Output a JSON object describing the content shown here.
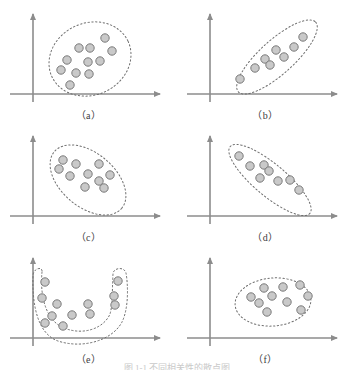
{
  "figure": {
    "caption_partial": "图 1-1  不同相关性的散点图",
    "axis_color": "#8c8c8c",
    "contour_color": "#6e6e6e",
    "dot_fill": "#c9c9c9",
    "dot_stroke": "#7a7a7a",
    "label_color": "#3c3c3c",
    "background": "#ffffff",
    "dot_radius": 4.2
  },
  "chart_data": {
    "type": "scatter",
    "xlabel": "",
    "ylabel": "",
    "grid": false,
    "legend": null,
    "panels": [
      {
        "id": "a",
        "label": "（a）",
        "description": "Circular / no-correlation cloud, dots spread evenly inside a round dotted contour",
        "correlation": "none",
        "contour_shape": "ellipse",
        "contour": {
          "cx": 90,
          "cy": 57,
          "rx": 42,
          "ry": 36,
          "rotate": -25
        },
        "points": [
          [
            105,
            36
          ],
          [
            79,
            46
          ],
          [
            90,
            46
          ],
          [
            112,
            49
          ],
          [
            67,
            58
          ],
          [
            88,
            60
          ],
          [
            100,
            59
          ],
          [
            61,
            68
          ],
          [
            76,
            71
          ],
          [
            89,
            72
          ],
          [
            70,
            83
          ]
        ]
      },
      {
        "id": "b",
        "label": "（b）",
        "description": "Strong positive linear correlation, narrow dotted ellipse tilted up to the right",
        "correlation": "strong positive",
        "contour_shape": "ellipse",
        "contour": {
          "cx": 100,
          "cy": 55,
          "rx": 52,
          "ry": 17,
          "rotate": -42
        },
        "points": [
          [
            126,
            35
          ],
          [
            117,
            45
          ],
          [
            99,
            48
          ],
          [
            107,
            55
          ],
          [
            88,
            57
          ],
          [
            93,
            63
          ],
          [
            78,
            66
          ],
          [
            63,
            77
          ]
        ]
      },
      {
        "id": "c",
        "label": "（c）",
        "description": "Moderate negative correlation, broad dotted ellipse tilted down to the right",
        "correlation": "moderate negative",
        "contour_shape": "ellipse",
        "contour": {
          "cx": 88,
          "cy": 56,
          "rx": 44,
          "ry": 27,
          "rotate": 40
        },
        "points": [
          [
            63,
            36
          ],
          [
            76,
            40
          ],
          [
            99,
            40
          ],
          [
            59,
            45
          ],
          [
            70,
            52
          ],
          [
            88,
            50
          ],
          [
            110,
            51
          ],
          [
            99,
            57
          ],
          [
            85,
            63
          ],
          [
            104,
            64
          ]
        ]
      },
      {
        "id": "d",
        "label": "（d）",
        "description": "Strong negative linear correlation, narrow dotted ellipse tilted down to the right",
        "correlation": "strong negative",
        "contour_shape": "ellipse",
        "contour": {
          "cx": 93,
          "cy": 56,
          "rx": 52,
          "ry": 16,
          "rotate": 40
        },
        "points": [
          [
            62,
            32
          ],
          [
            73,
            42
          ],
          [
            87,
            41
          ],
          [
            92,
            47
          ],
          [
            83,
            54
          ],
          [
            101,
            57
          ],
          [
            113,
            56
          ],
          [
            122,
            66
          ]
        ]
      },
      {
        "id": "e",
        "label": "（e）",
        "description": "Non-linear U-shaped (curvilinear) relation, dots follow a U-shaped dotted contour",
        "correlation": "non-linear",
        "contour_shape": "u-shape",
        "contour": {
          "path": "M 42,26 C 40,46 44,74 64,82 C 84,90 104,82 110,68 C 113,58 112,44 113,28 C 113,22 124,20 126,27 C 128,38 129,62 122,76 C 112,95 82,103 58,95 C 38,88 32,60 33,30 C 33,22 43,20 42,26 Z"
        },
        "points": [
          [
            45,
            36
          ],
          [
            118,
            35
          ],
          [
            42,
            52
          ],
          [
            114,
            50
          ],
          [
            57,
            58
          ],
          [
            88,
            58
          ],
          [
            115,
            59
          ],
          [
            52,
            70
          ],
          [
            72,
            69
          ],
          [
            90,
            68
          ],
          [
            45,
            77
          ],
          [
            63,
            80
          ]
        ]
      },
      {
        "id": "f",
        "label": "（f）",
        "description": "Weak / no correlation, compact horizontal dotted ellipse cloud",
        "correlation": "none",
        "contour_shape": "ellipse",
        "contour": {
          "cx": 96,
          "cy": 56,
          "rx": 38,
          "ry": 24,
          "rotate": -5
        },
        "points": [
          [
            87,
            42
          ],
          [
            106,
            41
          ],
          [
            123,
            39
          ],
          [
            74,
            51
          ],
          [
            95,
            50
          ],
          [
            131,
            50
          ],
          [
            82,
            57
          ],
          [
            110,
            56
          ],
          [
            90,
            66
          ],
          [
            124,
            64
          ]
        ]
      }
    ],
    "axes": {
      "x_axis": {
        "x1": 10,
        "y1": 92,
        "x2": 160,
        "y2": 92,
        "arrow": "right"
      },
      "y_axis": {
        "x1": 33,
        "y1": 100,
        "x2": 33,
        "y2": 12,
        "arrow": "up"
      }
    }
  }
}
